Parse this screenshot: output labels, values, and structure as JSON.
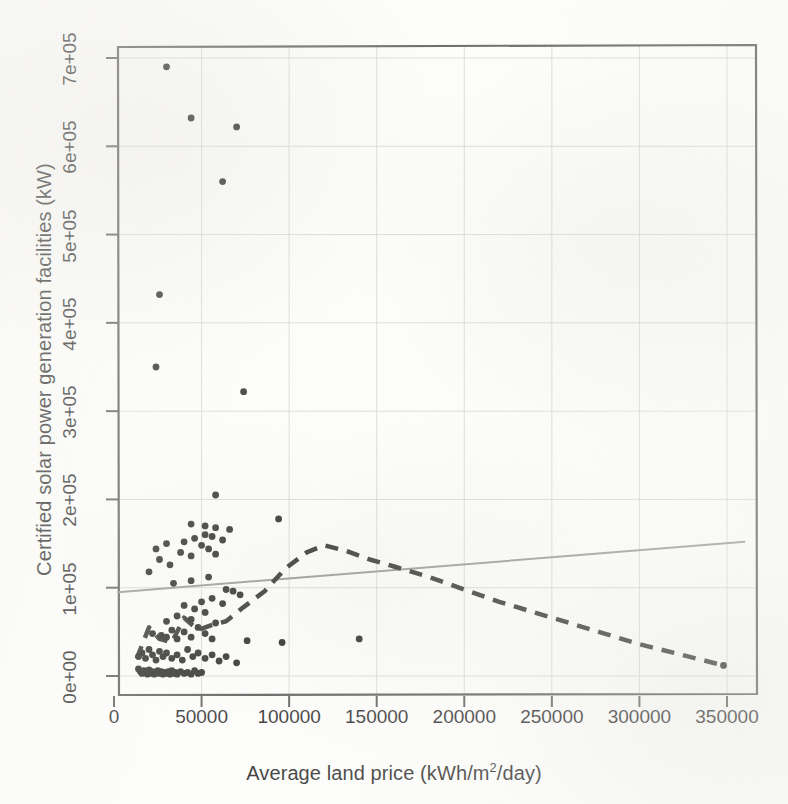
{
  "chart_data": {
    "type": "scatter",
    "title": "",
    "xlabel": "Average land price (kWh/m2/day)",
    "xlabel_prefix": "Average land price (kWh/m",
    "xlabel_sup": "2",
    "xlabel_suffix": "/day)",
    "ylabel": "Certified solar power generation facilities (kW)",
    "xlim": [
      0,
      360000
    ],
    "ylim": [
      -20000,
      730000
    ],
    "xticks": [
      0,
      50000,
      100000,
      150000,
      200000,
      250000,
      300000,
      350000
    ],
    "xticklabels": [
      "0",
      "50000",
      "100000",
      "150000",
      "200000",
      "250000",
      "300000",
      "350000"
    ],
    "yticks": [
      0,
      100000,
      200000,
      300000,
      400000,
      500000,
      600000,
      700000
    ],
    "yticklabels": [
      "0e+00",
      "1e+05",
      "2e+05",
      "3e+05",
      "4e+05",
      "5e+05",
      "6e+05",
      "7e+05"
    ],
    "grid": true,
    "grid_color": "#cfcfcf",
    "frame_color": "#4a4a4a",
    "point_color": "#111111",
    "point_size": 6,
    "legend": "none",
    "points": [
      [
        14000,
        8000
      ],
      [
        15000,
        5000
      ],
      [
        16000,
        3000
      ],
      [
        17000,
        6000
      ],
      [
        18000,
        4000
      ],
      [
        19000,
        2000
      ],
      [
        20000,
        7000
      ],
      [
        21000,
        3000
      ],
      [
        22000,
        5000
      ],
      [
        23000,
        2000
      ],
      [
        24000,
        4000
      ],
      [
        25000,
        6000
      ],
      [
        26000,
        3000
      ],
      [
        27000,
        5000
      ],
      [
        28000,
        2000
      ],
      [
        29000,
        4000
      ],
      [
        30000,
        3000
      ],
      [
        31000,
        5000
      ],
      [
        32000,
        2000
      ],
      [
        33000,
        6000
      ],
      [
        34000,
        3000
      ],
      [
        35000,
        4000
      ],
      [
        36000,
        2000
      ],
      [
        38000,
        5000
      ],
      [
        40000,
        3000
      ],
      [
        42000,
        4000
      ],
      [
        44000,
        2000
      ],
      [
        46000,
        6000
      ],
      [
        48000,
        3000
      ],
      [
        50000,
        4000
      ],
      [
        14000,
        22000
      ],
      [
        16000,
        26000
      ],
      [
        18000,
        20000
      ],
      [
        20000,
        30000
      ],
      [
        22000,
        24000
      ],
      [
        24000,
        18000
      ],
      [
        26000,
        28000
      ],
      [
        28000,
        22000
      ],
      [
        30000,
        26000
      ],
      [
        33000,
        20000
      ],
      [
        36000,
        24000
      ],
      [
        39000,
        18000
      ],
      [
        42000,
        30000
      ],
      [
        45000,
        22000
      ],
      [
        48000,
        26000
      ],
      [
        52000,
        20000
      ],
      [
        56000,
        24000
      ],
      [
        60000,
        17000
      ],
      [
        64000,
        22000
      ],
      [
        70000,
        15000
      ],
      [
        76000,
        40000
      ],
      [
        96000,
        38000
      ],
      [
        22000,
        48000
      ],
      [
        27000,
        46000
      ],
      [
        30000,
        44000
      ],
      [
        33000,
        52000
      ],
      [
        36000,
        42000
      ],
      [
        40000,
        50000
      ],
      [
        44000,
        44000
      ],
      [
        48000,
        55000
      ],
      [
        52000,
        48000
      ],
      [
        56000,
        42000
      ],
      [
        30000,
        62000
      ],
      [
        36000,
        68000
      ],
      [
        44000,
        64000
      ],
      [
        52000,
        72000
      ],
      [
        58000,
        60000
      ],
      [
        40000,
        80000
      ],
      [
        46000,
        76000
      ],
      [
        50000,
        84000
      ],
      [
        56000,
        88000
      ],
      [
        62000,
        82000
      ],
      [
        64000,
        98000
      ],
      [
        68000,
        96000
      ],
      [
        72000,
        92000
      ],
      [
        34000,
        105000
      ],
      [
        44000,
        108000
      ],
      [
        54000,
        112000
      ],
      [
        20000,
        118000
      ],
      [
        26000,
        132000
      ],
      [
        32000,
        126000
      ],
      [
        38000,
        140000
      ],
      [
        44000,
        136000
      ],
      [
        50000,
        148000
      ],
      [
        54000,
        144000
      ],
      [
        58000,
        138000
      ],
      [
        24000,
        144000
      ],
      [
        30000,
        150000
      ],
      [
        40000,
        152000
      ],
      [
        46000,
        156000
      ],
      [
        52000,
        160000
      ],
      [
        56000,
        158000
      ],
      [
        62000,
        154000
      ],
      [
        44000,
        172000
      ],
      [
        52000,
        170000
      ],
      [
        58000,
        168000
      ],
      [
        66000,
        166000
      ],
      [
        58000,
        205000
      ],
      [
        94000,
        178000
      ],
      [
        74000,
        322000
      ],
      [
        24000,
        350000
      ],
      [
        26000,
        432000
      ],
      [
        62000,
        560000
      ],
      [
        44000,
        632000
      ],
      [
        70000,
        622000
      ],
      [
        30000,
        690000
      ],
      [
        140000,
        42000
      ],
      [
        348000,
        12000
      ]
    ],
    "regression_line": {
      "style": "solid",
      "color": "#8d8d8d",
      "width": 2,
      "x": [
        0,
        360000
      ],
      "y": [
        95000,
        152000
      ]
    },
    "loess_line": {
      "style": "dashed",
      "color": "#1c1c1c",
      "width": 4.5,
      "points": [
        [
          13000,
          20000
        ],
        [
          20000,
          55000
        ],
        [
          26000,
          42000
        ],
        [
          33000,
          38000
        ],
        [
          40000,
          66000
        ],
        [
          48000,
          52000
        ],
        [
          56000,
          58000
        ],
        [
          64000,
          62000
        ],
        [
          74000,
          78000
        ],
        [
          86000,
          96000
        ],
        [
          98000,
          122000
        ],
        [
          110000,
          140000
        ],
        [
          120000,
          148000
        ],
        [
          132000,
          142000
        ],
        [
          146000,
          132000
        ],
        [
          160000,
          124000
        ],
        [
          180000,
          112000
        ],
        [
          200000,
          98000
        ],
        [
          220000,
          84000
        ],
        [
          240000,
          72000
        ],
        [
          260000,
          60000
        ],
        [
          280000,
          48000
        ],
        [
          300000,
          36000
        ],
        [
          320000,
          26000
        ],
        [
          348000,
          12000
        ]
      ]
    }
  }
}
